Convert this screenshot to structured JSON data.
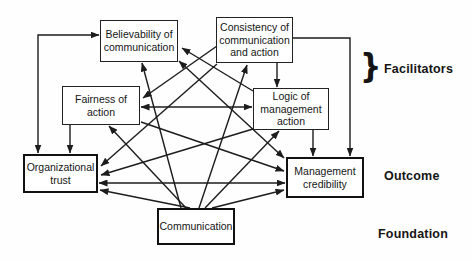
{
  "diagram": {
    "nodes": [
      {
        "id": "believability",
        "label_lines": [
          "Believability of",
          "communication"
        ],
        "x": 100,
        "y": 20,
        "w": 78,
        "h": 42,
        "border": "thin"
      },
      {
        "id": "consistency",
        "label_lines": [
          "Consistency of",
          "communication",
          "and action"
        ],
        "x": 216,
        "y": 17,
        "w": 77,
        "h": 46,
        "border": "thin"
      },
      {
        "id": "fairness",
        "label_lines": [
          "Fairness of",
          "action"
        ],
        "x": 62,
        "y": 86,
        "w": 78,
        "h": 39,
        "border": "thin"
      },
      {
        "id": "logic",
        "label_lines": [
          "Logic of",
          "management",
          "action"
        ],
        "x": 253,
        "y": 88,
        "w": 76,
        "h": 42,
        "border": "thin"
      },
      {
        "id": "organizational-trust",
        "label_lines": [
          "Organizational",
          "trust"
        ],
        "x": 23,
        "y": 154,
        "w": 75,
        "h": 39,
        "border": "thick"
      },
      {
        "id": "management-credibility",
        "label_lines": [
          "Management",
          "credibility"
        ],
        "x": 286,
        "y": 157,
        "w": 78,
        "h": 41,
        "border": "thick"
      },
      {
        "id": "communication",
        "label_lines": [
          "Communication"
        ],
        "x": 157,
        "y": 208,
        "w": 78,
        "h": 37,
        "border": "thick"
      }
    ],
    "edges": [
      {
        "name": "trust-believability",
        "points": [
          [
            38,
            153
          ],
          [
            38,
            35
          ],
          [
            99,
            35
          ]
        ],
        "arrows": "both"
      },
      {
        "name": "fairness-trust",
        "points": [
          [
            70,
            125
          ],
          [
            70,
            153
          ]
        ],
        "arrows": "end"
      },
      {
        "name": "consistency-logic",
        "points": [
          [
            277,
            63
          ],
          [
            277,
            87
          ]
        ],
        "arrows": "end"
      },
      {
        "name": "consistency-credibility-loop",
        "points": [
          [
            293,
            38
          ],
          [
            350,
            38
          ],
          [
            350,
            156
          ]
        ],
        "arrows": "end"
      },
      {
        "name": "logic-credibility",
        "points": [
          [
            313,
            130
          ],
          [
            313,
            156
          ]
        ],
        "arrows": "end"
      },
      {
        "name": "fairness-logic",
        "points": [
          [
            141,
            107
          ],
          [
            252,
            107
          ]
        ],
        "arrows": "both"
      },
      {
        "name": "trust-credibility",
        "points": [
          [
            99,
            183
          ],
          [
            285,
            183
          ]
        ],
        "arrows": "both"
      },
      {
        "name": "communication-trust",
        "points": [
          [
            190,
            208
          ],
          [
            100,
            190
          ]
        ],
        "arrows": "end"
      },
      {
        "name": "communication-fairness",
        "points": [
          [
            186,
            208
          ],
          [
            109,
            126
          ]
        ],
        "arrows": "end"
      },
      {
        "name": "communication-believability",
        "points": [
          [
            181,
            208
          ],
          [
            142,
            63
          ]
        ],
        "arrows": "end"
      },
      {
        "name": "communication-consistency",
        "points": [
          [
            199,
            208
          ],
          [
            247,
            65
          ]
        ],
        "arrows": "end"
      },
      {
        "name": "communication-logic",
        "points": [
          [
            205,
            208
          ],
          [
            279,
            131
          ]
        ],
        "arrows": "end"
      },
      {
        "name": "communication-credibility",
        "points": [
          [
            212,
            208
          ],
          [
            284,
            190
          ]
        ],
        "arrows": "end"
      },
      {
        "name": "consistency-fairness",
        "points": [
          [
            217,
            46
          ],
          [
            143,
            98
          ]
        ],
        "arrows": "end"
      },
      {
        "name": "consistency-trust",
        "points": [
          [
            217,
            64
          ],
          [
            101,
            166
          ]
        ],
        "arrows": "end"
      },
      {
        "name": "logic-trust",
        "points": [
          [
            253,
            129
          ],
          [
            101,
            175
          ]
        ],
        "arrows": "end"
      },
      {
        "name": "believability-credibility",
        "points": [
          [
            179,
            61
          ],
          [
            284,
            158
          ]
        ],
        "arrows": "both"
      },
      {
        "name": "logic-believability",
        "points": [
          [
            253,
            91
          ],
          [
            182,
            48
          ]
        ],
        "arrows": "end"
      },
      {
        "name": "fairness-credibility",
        "points": [
          [
            141,
            122
          ],
          [
            284,
            171
          ]
        ],
        "arrows": "end"
      }
    ],
    "side_labels": {
      "brace": "}",
      "facilitators": "Facilitators",
      "outcome": "Outcome",
      "foundation": "Foundation"
    }
  }
}
